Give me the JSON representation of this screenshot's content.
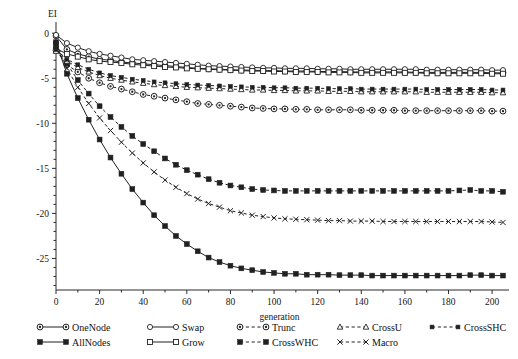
{
  "chart_data": {
    "type": "line",
    "title": "",
    "xlabel": "generation",
    "ylabel": "EI",
    "xlim": [
      0,
      205
    ],
    "ylim": [
      -28.5,
      0.8
    ],
    "xticks": [
      0,
      20,
      40,
      60,
      80,
      100,
      120,
      140,
      160,
      180,
      200
    ],
    "yticks": [
      0,
      -5,
      -10,
      -15,
      -20,
      -25
    ],
    "xtick_labels": [
      "0",
      "20",
      "40",
      "60",
      "80",
      "100",
      "120",
      "140",
      "160",
      "180",
      "200"
    ],
    "ytick_labels": [
      "0",
      "-5",
      "-10",
      "-15",
      "-20",
      "-25"
    ],
    "minor_xticks_per_major": 2,
    "minor_yticks_per_major": 5,
    "grid": false,
    "legend_position": "below",
    "x": [
      0,
      5,
      10,
      15,
      20,
      25,
      30,
      35,
      40,
      45,
      50,
      55,
      60,
      65,
      70,
      75,
      80,
      85,
      90,
      95,
      100,
      105,
      110,
      115,
      120,
      125,
      130,
      135,
      140,
      145,
      150,
      155,
      160,
      165,
      170,
      175,
      180,
      185,
      190,
      195,
      200,
      205
    ],
    "series": [
      {
        "name": "OneNode",
        "marker": "circle-open-dot",
        "line": "solid",
        "values": [
          -0.3,
          -1.8,
          -2.3,
          -2.6,
          -2.9,
          -3.0,
          -3.2,
          -3.3,
          -3.4,
          -3.5,
          -3.6,
          -3.7,
          -3.8,
          -3.9,
          -3.95,
          -4.0,
          -4.05,
          -4.1,
          -4.1,
          -4.15,
          -4.15,
          -4.2,
          -4.2,
          -4.2,
          -4.25,
          -4.25,
          -4.25,
          -4.3,
          -4.3,
          -4.3,
          -4.3,
          -4.3,
          -4.3,
          -4.35,
          -4.35,
          -4.35,
          -4.35,
          -4.35,
          -4.35,
          -4.35,
          -4.4,
          -4.4
        ]
      },
      {
        "name": "AllNodes",
        "marker": "square-filled",
        "line": "solid",
        "values": [
          -1.0,
          -4.5,
          -7.2,
          -9.6,
          -11.8,
          -13.8,
          -15.6,
          -17.3,
          -18.8,
          -20.2,
          -21.4,
          -22.5,
          -23.4,
          -24.2,
          -24.9,
          -25.4,
          -25.8,
          -26.1,
          -26.3,
          -26.5,
          -26.6,
          -26.7,
          -26.7,
          -26.8,
          -26.8,
          -26.8,
          -26.85,
          -26.85,
          -26.85,
          -26.9,
          -26.9,
          -26.9,
          -26.9,
          -26.9,
          -26.9,
          -26.9,
          -26.9,
          -26.9,
          -26.85,
          -26.85,
          -26.9,
          -26.9
        ]
      },
      {
        "name": "Swap",
        "marker": "circle-open",
        "line": "solid",
        "values": [
          -0.2,
          -1.1,
          -1.6,
          -2.0,
          -2.3,
          -2.5,
          -2.7,
          -2.9,
          -3.0,
          -3.1,
          -3.2,
          -3.3,
          -3.4,
          -3.5,
          -3.6,
          -3.65,
          -3.7,
          -3.75,
          -3.8,
          -3.85,
          -3.85,
          -3.9,
          -3.9,
          -3.9,
          -3.95,
          -3.95,
          -3.95,
          -4.0,
          -4.0,
          -4.0,
          -4.0,
          -4.0,
          -4.0,
          -4.0,
          -4.05,
          -4.05,
          -4.05,
          -4.05,
          -4.05,
          -4.05,
          -4.1,
          -4.1
        ]
      },
      {
        "name": "Grow",
        "marker": "square-open",
        "line": "solid",
        "values": [
          -1.7,
          -2.3,
          -2.6,
          -2.9,
          -3.1,
          -3.2,
          -3.3,
          -3.45,
          -3.55,
          -3.65,
          -3.75,
          -3.8,
          -3.9,
          -3.95,
          -4.0,
          -4.05,
          -4.1,
          -4.15,
          -4.2,
          -4.2,
          -4.25,
          -4.25,
          -4.3,
          -4.3,
          -4.3,
          -4.35,
          -4.35,
          -4.35,
          -4.4,
          -4.4,
          -4.4,
          -4.4,
          -4.4,
          -4.4,
          -4.45,
          -4.45,
          -4.45,
          -4.45,
          -4.45,
          -4.45,
          -4.5,
          -4.5
        ]
      },
      {
        "name": "Trunc",
        "marker": "circle-open-dot",
        "line": "dashed",
        "values": [
          -1.9,
          -3.5,
          -4.3,
          -5.0,
          -5.5,
          -5.9,
          -6.2,
          -6.5,
          -6.8,
          -7.0,
          -7.2,
          -7.4,
          -7.6,
          -7.8,
          -7.9,
          -8.0,
          -8.1,
          -8.2,
          -8.3,
          -8.35,
          -8.4,
          -8.4,
          -8.45,
          -8.45,
          -8.5,
          -8.5,
          -8.5,
          -8.5,
          -8.55,
          -8.55,
          -8.55,
          -8.55,
          -8.6,
          -8.6,
          -8.6,
          -8.6,
          -8.6,
          -8.6,
          -8.6,
          -8.6,
          -8.65,
          -8.65
        ]
      },
      {
        "name": "CrossWHC",
        "marker": "square-filled",
        "line": "dashed",
        "values": [
          -1.2,
          -3.4,
          -5.2,
          -6.7,
          -8.1,
          -9.3,
          -10.4,
          -11.4,
          -12.3,
          -13.1,
          -13.9,
          -14.6,
          -15.2,
          -15.7,
          -16.2,
          -16.6,
          -16.9,
          -17.1,
          -17.3,
          -17.4,
          -17.45,
          -17.5,
          -17.5,
          -17.5,
          -17.5,
          -17.5,
          -17.5,
          -17.5,
          -17.5,
          -17.5,
          -17.5,
          -17.5,
          -17.5,
          -17.5,
          -17.5,
          -17.5,
          -17.5,
          -17.45,
          -17.4,
          -17.5,
          -17.5,
          -17.6
        ]
      },
      {
        "name": "CrossU",
        "marker": "triangle-open",
        "line": "dashed",
        "values": [
          -2.0,
          -3.1,
          -3.8,
          -4.3,
          -4.7,
          -5.0,
          -5.2,
          -5.4,
          -5.55,
          -5.7,
          -5.8,
          -5.9,
          -6.0,
          -6.05,
          -6.1,
          -6.15,
          -6.2,
          -6.25,
          -6.3,
          -6.3,
          -6.35,
          -6.35,
          -6.4,
          -6.4,
          -6.4,
          -6.45,
          -6.45,
          -6.45,
          -6.5,
          -6.5,
          -6.5,
          -6.5,
          -6.5,
          -6.5,
          -6.55,
          -6.55,
          -6.55,
          -6.55,
          -6.55,
          -6.55,
          -6.6,
          -6.6
        ]
      },
      {
        "name": "Macro",
        "marker": "x",
        "line": "dashed",
        "values": [
          -1.4,
          -3.9,
          -6.0,
          -7.8,
          -9.4,
          -10.8,
          -12.1,
          -13.3,
          -14.4,
          -15.4,
          -16.3,
          -17.1,
          -17.8,
          -18.4,
          -18.9,
          -19.3,
          -19.7,
          -19.95,
          -20.2,
          -20.35,
          -20.5,
          -20.6,
          -20.65,
          -20.7,
          -20.75,
          -20.8,
          -20.8,
          -20.85,
          -20.85,
          -20.85,
          -20.9,
          -20.9,
          -20.9,
          -20.9,
          -20.9,
          -20.9,
          -20.9,
          -20.9,
          -20.9,
          -20.9,
          -20.95,
          -21.0
        ]
      },
      {
        "name": "CrossSHC",
        "marker": "square-filled-small",
        "line": "dashed",
        "values": [
          -1.8,
          -2.9,
          -3.5,
          -4.0,
          -4.4,
          -4.7,
          -4.9,
          -5.1,
          -5.25,
          -5.4,
          -5.5,
          -5.6,
          -5.7,
          -5.75,
          -5.8,
          -5.85,
          -5.9,
          -5.95,
          -6.0,
          -6.0,
          -6.05,
          -6.05,
          -6.1,
          -6.1,
          -6.1,
          -6.15,
          -6.15,
          -6.15,
          -6.2,
          -6.2,
          -6.2,
          -6.2,
          -6.2,
          -6.2,
          -6.25,
          -6.25,
          -6.25,
          -6.25,
          -6.25,
          -6.25,
          -6.3,
          -6.3
        ]
      }
    ]
  },
  "legend": {
    "entries": [
      {
        "label": "OneNode",
        "marker": "circle-open-dot",
        "line": "solid",
        "col": 0,
        "row": 0
      },
      {
        "label": "AllNodes",
        "marker": "square-filled",
        "line": "solid",
        "col": 0,
        "row": 1
      },
      {
        "label": "Swap",
        "marker": "circle-open",
        "line": "solid",
        "col": 1,
        "row": 0
      },
      {
        "label": "Grow",
        "marker": "square-open",
        "line": "solid",
        "col": 1,
        "row": 1
      },
      {
        "label": "Trunc",
        "marker": "circle-open-dot",
        "line": "dashed",
        "col": 2,
        "row": 0
      },
      {
        "label": "CrossWHC",
        "marker": "square-filled",
        "line": "dashed",
        "col": 2,
        "row": 1
      },
      {
        "label": "CrossU",
        "marker": "triangle-open",
        "line": "dashed",
        "col": 3,
        "row": 0
      },
      {
        "label": "Macro",
        "marker": "x",
        "line": "dashed",
        "col": 3,
        "row": 1
      },
      {
        "label": "CrossSHC",
        "marker": "square-filled-small",
        "line": "dashed",
        "col": 4,
        "row": 0
      }
    ]
  },
  "colors": {
    "ink": "#212121",
    "background": "#ffffff"
  }
}
